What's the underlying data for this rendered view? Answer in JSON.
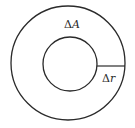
{
  "diagram": {
    "type": "annulus",
    "colors": {
      "stroke": "#2a2a2a",
      "background": "#ffffff"
    },
    "outer_circle": {
      "cx": 68,
      "cy": 63,
      "r": 57
    },
    "inner_circle": {
      "cx": 70,
      "cy": 64,
      "r": 27
    },
    "radial_segment": {
      "x1": 97,
      "y1": 66,
      "x2": 125,
      "y2": 66
    },
    "labels": {
      "area": {
        "symbol": "Δ",
        "variable": "A",
        "x": 64,
        "y": 28
      },
      "radius": {
        "symbol": "Δ",
        "variable": "r",
        "x": 102,
        "y": 82
      }
    }
  }
}
